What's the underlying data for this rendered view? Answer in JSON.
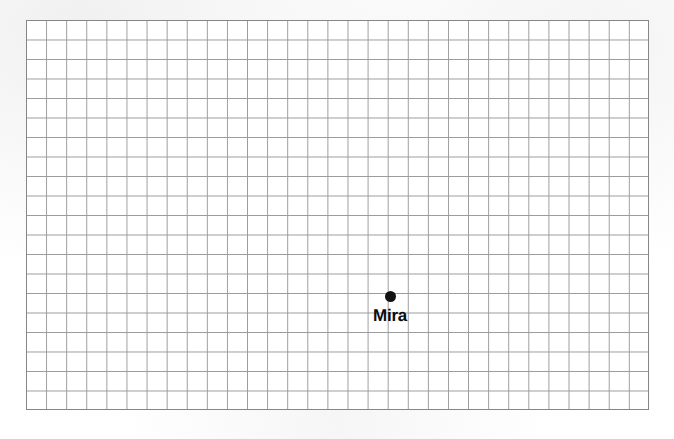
{
  "document": {
    "kind": "grid-reference-map",
    "background_color": "#ffffff"
  },
  "grid": {
    "left": 26,
    "top": 20,
    "width": 623,
    "height": 390,
    "columns": 31,
    "rows": 20,
    "cell_size": 20.1,
    "line_color": "#9b9b9d",
    "line_width": 1,
    "border_color": "#86868a",
    "border_width": 1
  },
  "markers": [
    {
      "name": "Mira",
      "label": "Mira",
      "x": 390,
      "y": 296,
      "dot_diameter": 11,
      "dot_color": "#121212",
      "label_color": "#0d0d0d",
      "label_x": 390,
      "label_top": 306,
      "label_font_size": 17
    }
  ]
}
